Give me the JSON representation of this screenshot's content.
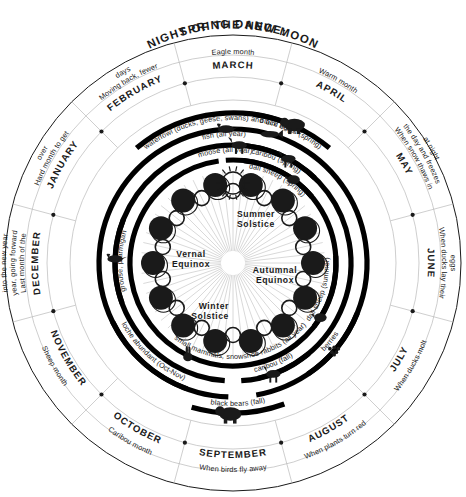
{
  "title": {
    "line1": "SPRING DANCE:",
    "line2": "NIGHT OF THE NEW MOON"
  },
  "chart_data": {
    "type": "pie",
    "legend_position": "none",
    "grid": false,
    "categories": [
      "MARCH",
      "APRIL",
      "MAY",
      "JUNE",
      "JULY",
      "AUGUST",
      "SEPTEMBER",
      "OCTOBER",
      "NOVEMBER",
      "DECEMBER",
      "JANUARY",
      "FEBRUARY"
    ],
    "values": [
      30,
      30,
      30,
      30,
      30,
      30,
      30,
      30,
      30,
      30,
      30,
      30
    ],
    "xlabel": "",
    "ylabel": ""
  },
  "months": [
    {
      "name": "MARCH",
      "meaning": "Eagle month",
      "start_deg": -15,
      "end_deg": 15
    },
    {
      "name": "APRIL",
      "meaning": "Warm month",
      "start_deg": 15,
      "end_deg": 45
    },
    {
      "name": "MAY",
      "meaning": "When snow thaws in the day and freezes at night",
      "start_deg": 45,
      "end_deg": 75
    },
    {
      "name": "JUNE",
      "meaning": "When ducks lay their eggs",
      "start_deg": 75,
      "end_deg": 105
    },
    {
      "name": "JULY",
      "meaning": "When ducks molt",
      "start_deg": 105,
      "end_deg": 135
    },
    {
      "name": "AUGUST",
      "meaning": "When plants turn red",
      "start_deg": 135,
      "end_deg": 165
    },
    {
      "name": "SEPTEMBER",
      "meaning": "When birds fly away",
      "start_deg": 165,
      "end_deg": 195
    },
    {
      "name": "OCTOBER",
      "meaning": "Caribou month",
      "start_deg": 195,
      "end_deg": 225
    },
    {
      "name": "NOVEMBER",
      "meaning": "Sheep month",
      "start_deg": 225,
      "end_deg": 255
    },
    {
      "name": "DECEMBER",
      "meaning": "Last month of the year, going forward into the new year",
      "start_deg": 255,
      "end_deg": 285
    },
    {
      "name": "JANUARY",
      "meaning": "Hard month to get over",
      "start_deg": 285,
      "end_deg": 315
    },
    {
      "name": "FEBRUARY",
      "meaning": "Moving back, fewer days",
      "start_deg": 315,
      "end_deg": 345
    }
  ],
  "resource_bands": [
    {
      "label": "waterfowl (ducks, geese, swans) and bird eggs",
      "start_deg": -40,
      "end_deg": 28,
      "radius": 150
    },
    {
      "label": "black bears (spring)",
      "start_deg": 8,
      "end_deg": 40,
      "radius": 150
    },
    {
      "label": "fish (all year)",
      "start_deg": -178,
      "end_deg": 170,
      "radius": 134
    },
    {
      "label": "caribou (spring)",
      "start_deg": 2,
      "end_deg": 44,
      "radius": 118
    },
    {
      "label": "moose (all year)",
      "start_deg": -176,
      "end_deg": 168,
      "radius": 118
    },
    {
      "label": "dall sheep (spring)",
      "start_deg": 6,
      "end_deg": 50,
      "radius": 103
    },
    {
      "label": "dall sheep (summer)",
      "start_deg": 86,
      "end_deg": 128,
      "radius": 103
    },
    {
      "label": "berries",
      "start_deg": 112,
      "end_deg": 146,
      "radius": 134
    },
    {
      "label": "caribou (fall)",
      "start_deg": 140,
      "end_deg": 176,
      "radius": 118
    },
    {
      "label": "small mammals, snowshoe rabbits (all year)",
      "start_deg": -4,
      "end_deg": 352,
      "radius": 103
    },
    {
      "label": "loche abundant (Oct-Nov)",
      "start_deg": 200,
      "end_deg": 244,
      "radius": 134
    },
    {
      "label": "grouse, ptarmigan",
      "start_deg": 250,
      "end_deg": 292,
      "radius": 118
    },
    {
      "label": "black bears (fall)",
      "start_deg": 160,
      "end_deg": 196,
      "radius": 150
    }
  ],
  "solar_markers": [
    {
      "label_line1": "Vernal",
      "label_line2": "Equinox",
      "angle_deg": -90
    },
    {
      "label_line1": "Summer",
      "label_line2": "Solstice",
      "angle_deg": 0
    },
    {
      "label_line1": "Autumnal",
      "label_line2": "Equinox",
      "angle_deg": 90
    },
    {
      "label_line1": "Winter",
      "label_line2": "Solstice",
      "angle_deg": 180
    }
  ],
  "icons": {
    "sun": "sun-icon",
    "bear_spring": "black-bear-icon",
    "bear_fall": "black-bear-icon",
    "eagle": "eagle-icon",
    "fish": "fish-icon",
    "moose": "moose-icon",
    "caribou_spring": "caribou-icon",
    "caribou_fall": "caribou-icon",
    "sheep_spring": "dall-sheep-icon",
    "sheep_summer": "dall-sheep-icon",
    "rabbit": "snowshoe-rabbit-icon",
    "ptarmigan": "grouse-ptarmigan-icon",
    "berries": "berries-icon"
  },
  "colors": {
    "ink": "#1a1a1a",
    "hairline": "#b9b9b9",
    "band": "#000000",
    "paper": "#ffffff"
  },
  "moon_count": 28
}
